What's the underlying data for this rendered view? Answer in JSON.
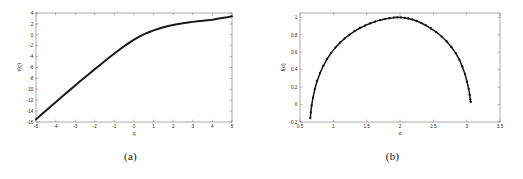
{
  "figure": {
    "background": "#ffffff",
    "curve_color": "#1a1a1a",
    "axis_color": "#6f6f6f",
    "panel_a_caption": "(a)",
    "panel_b_caption": "(b)"
  },
  "chart_data": [
    {
      "type": "line",
      "panel": "(a)",
      "title": "",
      "xlabel": "q",
      "ylabel": "τ(q)",
      "xlim": [
        -5,
        5
      ],
      "ylim": [
        -16,
        4
      ],
      "xticks": [
        -5,
        -4,
        -3,
        -2,
        -1,
        0,
        1,
        2,
        3,
        4,
        5
      ],
      "xtick_labels": [
        "-5",
        "-4",
        "-3",
        "-2",
        "-1",
        "0",
        "1",
        "2",
        "3",
        "4",
        "5"
      ],
      "yticks": [
        4,
        2,
        0,
        -2,
        -4,
        -6,
        -8,
        -10,
        -12,
        -14,
        -16
      ],
      "ytick_labels": [
        "4",
        "2",
        "0",
        "-2",
        "-4",
        "-6",
        "-8",
        "-10",
        "-12",
        "-14",
        "-16"
      ],
      "grid": false,
      "legend": "none",
      "markers": false,
      "x": [
        -5,
        -4.75,
        -4.5,
        -4.25,
        -4,
        -3.75,
        -3.5,
        -3.25,
        -3,
        -2.75,
        -2.5,
        -2.25,
        -2,
        -1.75,
        -1.5,
        -1.25,
        -1,
        -0.75,
        -0.5,
        -0.25,
        0,
        0.25,
        0.5,
        0.75,
        1,
        1.25,
        1.5,
        1.75,
        2,
        2.25,
        2.5,
        2.75,
        3,
        3.25,
        3.5,
        3.75,
        4,
        4.25,
        4.5,
        4.75,
        5
      ],
      "y": [
        -15.5,
        -14.72,
        -13.94,
        -13.16,
        -12.38,
        -11.6,
        -10.83,
        -10.06,
        -9.3,
        -8.54,
        -7.79,
        -7.04,
        -6.3,
        -5.57,
        -4.85,
        -4.13,
        -3.43,
        -2.75,
        -2.09,
        -1.47,
        -0.9,
        -0.38,
        0.08,
        0.47,
        0.82,
        1.12,
        1.38,
        1.6,
        1.8,
        1.97,
        2.12,
        2.25,
        2.37,
        2.48,
        2.58,
        2.67,
        2.76,
        2.94,
        3.08,
        3.22,
        3.4
      ]
    },
    {
      "type": "line",
      "panel": "(b)",
      "title": "",
      "xlabel": "α",
      "ylabel": "f(α)",
      "xlim": [
        0.5,
        3.5
      ],
      "ylim": [
        -0.2,
        1.05
      ],
      "xticks": [
        0.5,
        1,
        1.5,
        2,
        2.5,
        3,
        3.5
      ],
      "xtick_labels": [
        "0.5",
        "1",
        "1.5",
        "2",
        "2.5",
        "3",
        "3.5"
      ],
      "yticks": [
        -0.2,
        0,
        0.2,
        0.4,
        0.6,
        0.8,
        1
      ],
      "ytick_labels": [
        "-0.2",
        "0",
        "0.2",
        "0.4",
        "0.6",
        "0.8",
        "1"
      ],
      "grid": false,
      "legend": "none",
      "markers": true,
      "x": [
        0.655,
        0.662,
        0.675,
        0.695,
        0.722,
        0.757,
        0.8,
        0.85,
        0.905,
        0.965,
        1.03,
        1.1,
        1.17,
        1.245,
        1.32,
        1.4,
        1.475,
        1.55,
        1.625,
        1.7,
        1.77,
        1.84,
        1.905,
        1.96,
        2.015,
        2.07,
        2.125,
        2.185,
        2.25,
        2.32,
        2.39,
        2.465,
        2.545,
        2.625,
        2.7,
        2.77,
        2.835,
        2.89,
        2.935,
        2.975,
        3.005,
        3.03,
        3.045,
        3.055,
        3.06
      ],
      "y": [
        -0.155,
        -0.09,
        -0.01,
        0.08,
        0.175,
        0.27,
        0.36,
        0.445,
        0.52,
        0.59,
        0.653,
        0.71,
        0.758,
        0.803,
        0.843,
        0.878,
        0.906,
        0.93,
        0.951,
        0.968,
        0.98,
        0.99,
        0.997,
        1.0,
        0.999,
        0.995,
        0.987,
        0.975,
        0.958,
        0.935,
        0.907,
        0.872,
        0.83,
        0.78,
        0.723,
        0.66,
        0.59,
        0.515,
        0.435,
        0.35,
        0.262,
        0.18,
        0.11,
        0.06,
        0.03
      ]
    }
  ]
}
